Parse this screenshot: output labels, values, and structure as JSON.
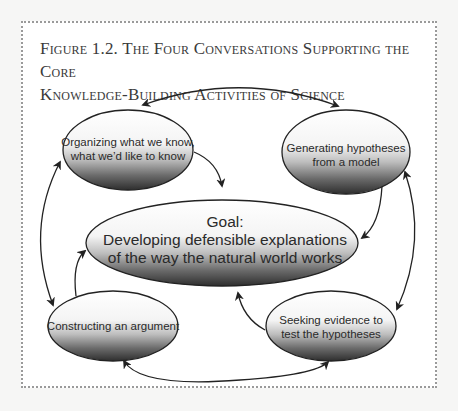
{
  "figure": {
    "title_line1": "Figure 1.2. The Four Conversations Supporting the Core",
    "title_line2": "Knowledge-Building Activities of Science"
  },
  "nodes": {
    "organizing": {
      "line1": "Organizing what we know,",
      "line2": "what we’d like to know"
    },
    "generating": {
      "line1": "Generating hypotheses",
      "line2": "from a model"
    },
    "goal": {
      "line1": "Goal:",
      "line2": "Developing defensible explanations",
      "line3": "of the way the natural world works"
    },
    "constructing": {
      "line1": "Constructing an argument"
    },
    "seeking": {
      "line1": "Seeking evidence to",
      "line2": "test the hypotheses"
    }
  },
  "colors": {
    "frame_border": "#9a9a9a",
    "stroke": "#222222",
    "ellipse_light": "#ffffff",
    "ellipse_dark": "#2e2e2e",
    "text": "#2a2a2a"
  }
}
